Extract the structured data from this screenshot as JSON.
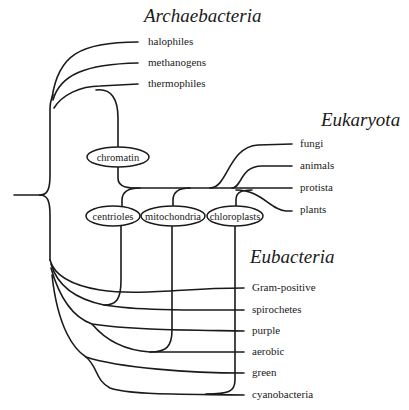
{
  "groups": {
    "archaebacteria": "Archaebacteria",
    "eukaryota": "Eukaryota",
    "eubacteria": "Eubacteria"
  },
  "leaves": {
    "archaebacteria": [
      "halophiles",
      "methanogens",
      "thermophiles"
    ],
    "eukaryota": [
      "fungi",
      "animals",
      "protista",
      "plants"
    ],
    "eubacteria": [
      "Gram-positive",
      "spirochetes",
      "purple",
      "aerobic",
      "green",
      "cyanobacteria"
    ]
  },
  "events": {
    "chromatin": "chromatin",
    "centrioles": "centrioles",
    "mitochondria": "mitochondria",
    "chloroplasts": "chloroplasts"
  },
  "colors": {
    "line": "#1a1a1a",
    "background": "#ffffff"
  }
}
